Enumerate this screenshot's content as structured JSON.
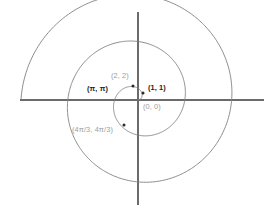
{
  "figure": {
    "title": "",
    "background_color": "#ffffff",
    "axis_color": "#6b6b6b",
    "curve_color": "#7f7f7f",
    "label_dark_color": "#1c1c1c",
    "label_gray_color": "#9d9d9d",
    "marker_color": "#2a2a2a"
  },
  "chart_data": {
    "type": "line",
    "title": "",
    "xlabel": "",
    "ylabel": "",
    "curve_name": "Archimedean spiral r = theta",
    "coordinate_system": "polar",
    "equation": "r = theta",
    "theta_range": [
      0,
      15.708
    ],
    "xlim": [
      -8.8,
      7.2
    ],
    "ylim": [
      -6.4,
      6.4
    ],
    "grid": false,
    "legend": null,
    "axes": {
      "x_axis_y_pixel": 100,
      "y_axis_x_pixel": 138,
      "x_axis_extent_px": [
        20,
        264
      ],
      "y_axis_extent_px": [
        12,
        205
      ]
    },
    "annotations": [
      {
        "label": "(0, 0)",
        "theta": 0,
        "r": 0,
        "marked": false,
        "style": "gray",
        "px": 143,
        "py": 103
      },
      {
        "label": "(1, 1)",
        "theta": 1,
        "r": 1,
        "marked": true,
        "style": "dark",
        "px": 148,
        "py": 84,
        "marker_px": 143,
        "marker_py": 93
      },
      {
        "label": "(2, 2)",
        "theta": 2,
        "r": 2,
        "marked": true,
        "style": "gray",
        "px": 111,
        "py": 72,
        "marker_px": 133,
        "marker_py": 86
      },
      {
        "label": "(π, π)",
        "theta": 3.1416,
        "r": 3.1416,
        "marked": false,
        "style": "dark",
        "px": 87,
        "py": 85,
        "marker_px": 124,
        "marker_py": 100
      },
      {
        "label": "(4π/3, 4π/3)",
        "theta": 4.1888,
        "r": 4.1888,
        "marked": true,
        "style": "gray",
        "px": 72,
        "py": 126,
        "marker_px": 124,
        "marker_py": 125
      }
    ],
    "series": [
      {
        "name": "r = theta",
        "points_polar_sample": [
          [
            0,
            0
          ],
          [
            1,
            1
          ],
          [
            2,
            2
          ],
          [
            3.1416,
            3.1416
          ],
          [
            4.1888,
            4.1888
          ],
          [
            6.2832,
            6.2832
          ],
          [
            9.4248,
            9.4248
          ],
          [
            12.5664,
            12.5664
          ],
          [
            15.708,
            15.708
          ]
        ]
      }
    ]
  }
}
